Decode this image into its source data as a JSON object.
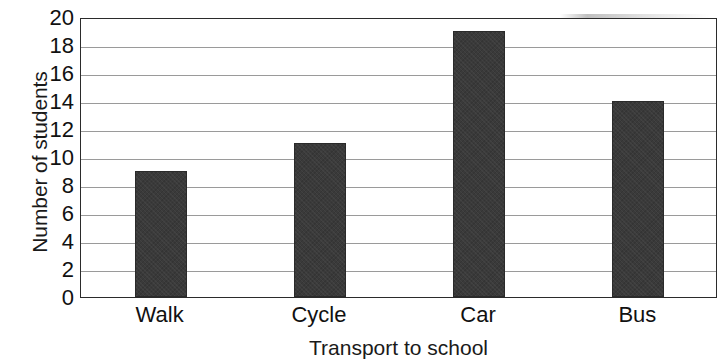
{
  "chart_data": {
    "type": "bar",
    "title": "",
    "categories": [
      "Walk",
      "Cycle",
      "Car",
      "Bus"
    ],
    "values": [
      9,
      11,
      19,
      14
    ],
    "xlabel": "Transport to school",
    "ylabel": "Number of students",
    "ylim": [
      0,
      20
    ],
    "ytick_step": 2,
    "yticks": [
      20,
      18,
      16,
      14,
      12,
      10,
      8,
      6,
      4,
      2,
      0
    ],
    "ytick_labels": [
      "20",
      "18",
      "16",
      "14",
      "12",
      "10",
      "8",
      "6",
      "4",
      "2",
      "0"
    ],
    "grid": true,
    "grid_axis": "y",
    "legend": false,
    "legend_position": "none",
    "bar_color": "#3a3a3a",
    "grid_color": "#9a9a9a",
    "axis_color": "#2b2b2b",
    "background_color": "#ffffff"
  }
}
